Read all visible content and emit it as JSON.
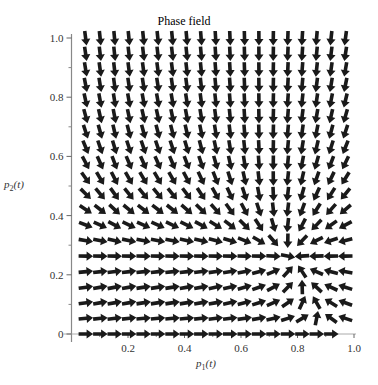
{
  "chart_data": {
    "type": "vector_field",
    "title": "Phase field",
    "xlabel": "p1(t)",
    "ylabel": "p2(t)",
    "xlim": [
      0,
      1.0
    ],
    "ylim": [
      0,
      1.0
    ],
    "x_ticks": [
      "0.2",
      "0.4",
      "0.6",
      "0.8",
      "1.0"
    ],
    "x_tick_values": [
      0.2,
      0.4,
      0.6,
      0.8,
      1.0
    ],
    "y_ticks": [
      "0",
      "0.2",
      "0.4",
      "0.6",
      "0.8",
      "1.0"
    ],
    "y_tick_values": [
      0,
      0.2,
      0.4,
      0.6,
      0.8,
      1.0
    ],
    "y_minor_step": 0.1,
    "x_minor_step": 0.1,
    "grid": false,
    "legend": null,
    "arrow_grid": {
      "x_start": 0.05,
      "x_end": 0.97,
      "x_count": 19,
      "y_start": 0.0,
      "y_end": 1.0,
      "y_count": 20
    },
    "equilibrium_point": [
      0.78,
      0.26
    ],
    "field_description": "Arrows converge to a stable node near (0.78, 0.26); bottom row p2=0 points right; top-left points down-right; top-right points down-left; vertical-down column near p1=0.7 at top.",
    "arrow_color": "#1a1a1a"
  },
  "axes": {
    "x_label_main": "p",
    "x_label_sub": "1",
    "x_label_tail": "(t)",
    "y_label_main": "p",
    "y_label_sub": "2",
    "y_label_tail": "(t)"
  }
}
